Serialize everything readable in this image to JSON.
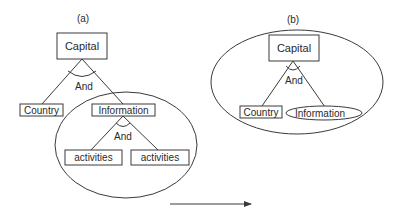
{
  "panels": {
    "a": {
      "caption": "(a)",
      "root": "Capital",
      "root_and": "And",
      "children": [
        "Country",
        "Information"
      ],
      "sub_and": "And",
      "sub_children": [
        "activities",
        "activities"
      ]
    },
    "b": {
      "caption": "(b)",
      "root": "Capital",
      "root_and": "And",
      "children": [
        "Country",
        "Information"
      ]
    }
  },
  "arrow": {
    "direction": "right"
  }
}
